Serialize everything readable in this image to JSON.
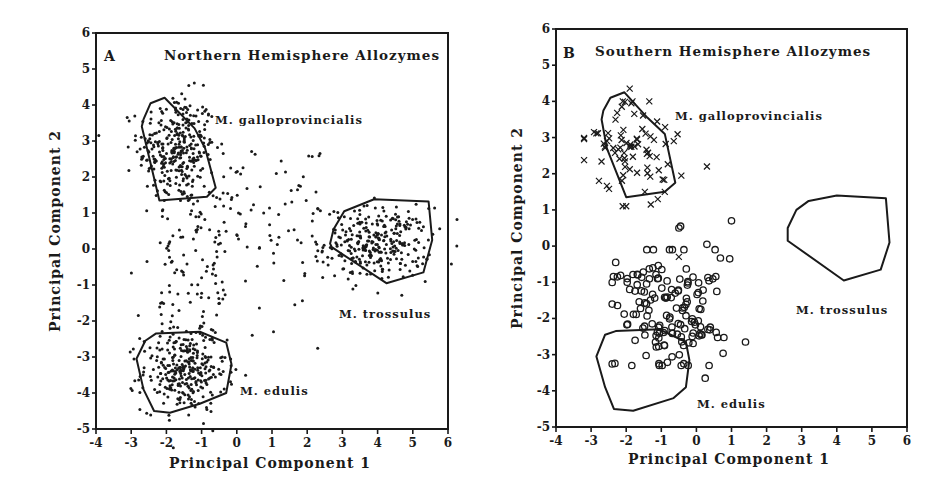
{
  "figure": {
    "panels": [
      {
        "id": "A",
        "letter": "A",
        "title": "Northern Hemisphere Allozymes",
        "xlabel": "Principal Component 1",
        "ylabel": "Principal Component 2"
      },
      {
        "id": "B",
        "letter": "B",
        "title": "Southern Hemisphere Allozymes",
        "xlabel": "Principal Component 1",
        "ylabel": "Principal Component 2"
      }
    ],
    "species_labels": {
      "galloprovincialis": "M. galloprovincialis",
      "trossulus": "M. trossulus",
      "edulis": "M. edulis"
    }
  },
  "chart_data": [
    {
      "type": "scatter",
      "title": "Northern Hemisphere Allozymes",
      "panel_letter": "A",
      "xlabel": "Principal Component 1",
      "ylabel": "Principal Component 2",
      "xlim": [
        -4,
        6
      ],
      "ylim": [
        -5,
        6
      ],
      "xticks": [
        -4,
        -3,
        -2,
        -1,
        0,
        1,
        2,
        3,
        4,
        5,
        6
      ],
      "yticks": [
        -5,
        -4,
        -3,
        -2,
        -1,
        0,
        1,
        2,
        3,
        4,
        5,
        6
      ],
      "grid": false,
      "marker": "dot",
      "series": [
        {
          "name": "M. galloprovincialis",
          "center": [
            -1.7,
            2.8
          ],
          "spread": [
            0.55,
            0.75
          ],
          "n": 320,
          "hull": [
            [
              -2.65,
              3.6
            ],
            [
              -2.45,
              4.05
            ],
            [
              -2.05,
              4.2
            ],
            [
              -1.2,
              3.35
            ],
            [
              -0.9,
              2.8
            ],
            [
              -0.6,
              1.7
            ],
            [
              -0.85,
              1.45
            ],
            [
              -2.2,
              1.35
            ],
            [
              -2.7,
              3.4
            ]
          ]
        },
        {
          "name": "M. trossulus",
          "center": [
            4.0,
            0.15
          ],
          "spread": [
            0.75,
            0.5
          ],
          "n": 300,
          "hull": [
            [
              2.65,
              0.15
            ],
            [
              2.75,
              0.55
            ],
            [
              3.05,
              1.05
            ],
            [
              3.9,
              1.38
            ],
            [
              5.45,
              1.32
            ],
            [
              5.55,
              0.25
            ],
            [
              5.3,
              -0.65
            ],
            [
              4.25,
              -0.95
            ],
            [
              2.7,
              0.05
            ]
          ]
        },
        {
          "name": "M. edulis",
          "center": [
            -1.5,
            -3.4
          ],
          "spread": [
            0.6,
            0.55
          ],
          "n": 300,
          "hull": [
            [
              -2.85,
              -3.05
            ],
            [
              -2.6,
              -2.55
            ],
            [
              -2.3,
              -2.35
            ],
            [
              -1.05,
              -2.3
            ],
            [
              -0.3,
              -2.6
            ],
            [
              -0.15,
              -3.2
            ],
            [
              -0.3,
              -4.0
            ],
            [
              -1.05,
              -4.3
            ],
            [
              -1.9,
              -4.55
            ],
            [
              -2.35,
              -4.5
            ],
            [
              -2.65,
              -3.9
            ]
          ]
        },
        {
          "name": "intermediate",
          "n": 200,
          "points_note": "scattered points between clusters, x -3.2 to 2.5, y -2.8 to 2.8"
        }
      ],
      "annotations": [
        {
          "text": "M. galloprovincialis",
          "x": -0.6,
          "y": 3.6
        },
        {
          "text": "M. trossulus",
          "x": 3.0,
          "y": -1.8
        },
        {
          "text": "M. edulis",
          "x": 0.05,
          "y": -3.95
        }
      ]
    },
    {
      "type": "scatter",
      "title": "Southern Hemisphere Allozymes",
      "panel_letter": "B",
      "xlabel": "Principal Component 1",
      "ylabel": "Principal Component 2",
      "xlim": [
        -4,
        6
      ],
      "ylim": [
        -5,
        6
      ],
      "xticks": [
        -4,
        -3,
        -2,
        -1,
        0,
        1,
        2,
        3,
        4,
        5,
        6
      ],
      "yticks": [
        -5,
        -4,
        -3,
        -2,
        -1,
        0,
        1,
        2,
        3,
        4,
        5,
        6
      ],
      "grid": false,
      "series": [
        {
          "name": "M. galloprovincialis (southern samples)",
          "marker": "x",
          "center": [
            -1.9,
            2.75
          ],
          "spread": [
            0.65,
            0.7
          ],
          "n": 75,
          "extra_points": [
            [
              -1.9,
              4.35
            ],
            [
              0.3,
              2.2
            ],
            [
              -2.1,
              1.1
            ],
            [
              -2.0,
              1.1
            ],
            [
              -1.3,
              1.15
            ],
            [
              -1.1,
              1.3
            ],
            [
              -0.5,
              -0.3
            ]
          ]
        },
        {
          "name": "southern samples (edulis-like)",
          "marker": "o",
          "center": [
            -0.8,
            -1.9
          ],
          "spread": [
            0.75,
            0.8
          ],
          "n": 150,
          "extra_points": [
            [
              -0.5,
              0.5
            ],
            [
              -0.45,
              0.55
            ],
            [
              0.3,
              0.05
            ],
            [
              1.0,
              0.7
            ],
            [
              0.95,
              -0.35
            ],
            [
              1.4,
              -2.65
            ],
            [
              0.25,
              -3.65
            ],
            [
              -2.3,
              -0.45
            ],
            [
              -2.25,
              -0.85
            ]
          ]
        }
      ],
      "hulls": [
        {
          "name": "M. galloprovincialis",
          "points": [
            [
              -2.65,
              3.75
            ],
            [
              -2.45,
              4.1
            ],
            [
              -2.05,
              4.25
            ],
            [
              -1.4,
              3.55
            ],
            [
              -0.9,
              3.1
            ],
            [
              -0.6,
              1.75
            ],
            [
              -0.9,
              1.5
            ],
            [
              -2.0,
              1.35
            ],
            [
              -2.55,
              2.7
            ],
            [
              -2.7,
              3.5
            ]
          ]
        },
        {
          "name": "M. trossulus",
          "points": [
            [
              2.6,
              0.15
            ],
            [
              2.6,
              0.5
            ],
            [
              2.85,
              1.0
            ],
            [
              3.2,
              1.25
            ],
            [
              4.0,
              1.4
            ],
            [
              5.4,
              1.32
            ],
            [
              5.5,
              0.1
            ],
            [
              5.25,
              -0.65
            ],
            [
              4.2,
              -0.95
            ],
            [
              2.6,
              0.15
            ]
          ]
        },
        {
          "name": "M. edulis",
          "points": [
            [
              -2.85,
              -3.05
            ],
            [
              -2.6,
              -2.45
            ],
            [
              -2.3,
              -2.35
            ],
            [
              -1.05,
              -2.3
            ],
            [
              -0.3,
              -2.65
            ],
            [
              -0.2,
              -3.15
            ],
            [
              -0.3,
              -3.9
            ],
            [
              -0.65,
              -4.2
            ],
            [
              -1.8,
              -4.55
            ],
            [
              -2.35,
              -4.5
            ],
            [
              -2.6,
              -3.9
            ]
          ]
        }
      ],
      "annotations": [
        {
          "text": "M. galloprovincialis",
          "x": -0.6,
          "y": 3.75
        },
        {
          "text": "M. trossulus",
          "x": 2.85,
          "y": -1.65
        },
        {
          "text": "M. edulis",
          "x": 0.0,
          "y": -4.3
        }
      ]
    }
  ]
}
